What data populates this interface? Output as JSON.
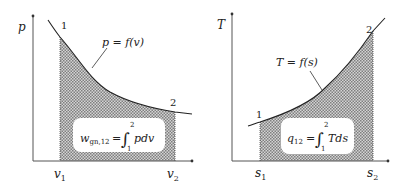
{
  "diagrams": [
    {
      "name": "p-v diagram",
      "y_axis_label": "p",
      "x_tick_1": "v",
      "x_tick_1_sub": "1",
      "x_tick_2": "v",
      "x_tick_2_sub": "2",
      "point_1": "1",
      "point_2": "2",
      "curve_label": "p = f(v)",
      "formula_lhs": "w",
      "formula_lhs_sub": "gn,12",
      "formula_eq": "=",
      "integral_upper": "2",
      "integral_lower": "1",
      "integrand": "pdv"
    },
    {
      "name": "T-s diagram",
      "y_axis_label": "T",
      "x_tick_1": "s",
      "x_tick_1_sub": "1",
      "x_tick_2": "s",
      "x_tick_2_sub": "2",
      "point_1": "1",
      "point_2": "2",
      "curve_label": "T = f(s)",
      "formula_lhs": "q",
      "formula_lhs_sub": "12",
      "formula_eq": "=",
      "integral_upper": "2",
      "integral_lower": "1",
      "integrand": "Tds"
    }
  ],
  "colors": {
    "line": "#222222",
    "hatch_dark": "#8a8a8a",
    "hatch_light": "#d8d8d8",
    "box_fill": "#ffffff"
  }
}
